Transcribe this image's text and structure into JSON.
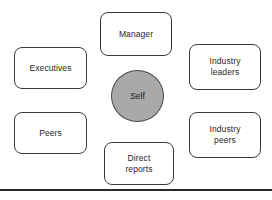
{
  "diagram": {
    "type": "360-degree-feedback-map",
    "background_color": "#ffffff",
    "center": {
      "label": "Self",
      "shape": "circle",
      "fill_color": "#a9a9a9",
      "border_color": "#4a4a4a"
    },
    "nodes": [
      {
        "id": "manager",
        "label": "Manager",
        "position": "top"
      },
      {
        "id": "executives",
        "label": "Executives",
        "position": "left-upper"
      },
      {
        "id": "peers",
        "label": "Peers",
        "position": "left-lower"
      },
      {
        "id": "industry-leaders",
        "label": "Industry\nleaders",
        "position": "right-upper"
      },
      {
        "id": "industry-peers",
        "label": "Industry\npeers",
        "position": "right-lower"
      },
      {
        "id": "direct-reports",
        "label": "Direct\nreports",
        "position": "bottom"
      }
    ],
    "node_style": {
      "shape": "rounded-rectangle",
      "fill_color": "#ffffff",
      "border_color": "#3b3b3b"
    },
    "baseline_rule": {
      "color": "#2a2a2a",
      "thickness_px": 2
    }
  }
}
